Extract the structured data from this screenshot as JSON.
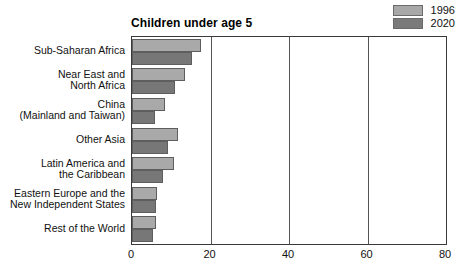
{
  "chart_data": {
    "type": "bar",
    "orientation": "horizontal",
    "title": "Children under age 5",
    "xlabel": "",
    "ylabel": "",
    "xlim": [
      0,
      80
    ],
    "xticks": [
      0,
      20,
      40,
      60,
      80
    ],
    "grid": true,
    "legend_position": "top-right",
    "categories": [
      "Sub-Saharan Africa",
      "Near East and\nNorth Africa",
      "China\n(Mainland and Taiwan)",
      "Other Asia",
      "Latin America and\nthe Caribbean",
      "Eastern Europe and the\nNew Independent States",
      "Rest of the World"
    ],
    "series": [
      {
        "name": "1996",
        "color": "#a9a9a9",
        "values": [
          17.7,
          13.4,
          8.4,
          11.7,
          10.7,
          6.4,
          6.1
        ]
      },
      {
        "name": "2020",
        "color": "#777777",
        "values": [
          15.2,
          10.9,
          5.9,
          9.1,
          7.9,
          6.1,
          5.3
        ]
      }
    ]
  },
  "legend": {
    "entries": [
      {
        "label": "1996",
        "swatch": "legend-swatch-1996"
      },
      {
        "label": "2020",
        "swatch": "legend-swatch-2020"
      }
    ]
  }
}
